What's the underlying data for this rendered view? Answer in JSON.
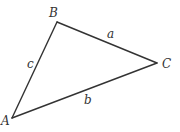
{
  "diagram": {
    "type": "triangle",
    "vertices": [
      {
        "id": "A",
        "label": "A",
        "x": 12,
        "y": 118,
        "label_x": 1,
        "label_y": 125
      },
      {
        "id": "B",
        "label": "B",
        "x": 57,
        "y": 22,
        "label_x": 49,
        "label_y": 17
      },
      {
        "id": "C",
        "label": "C",
        "x": 157,
        "y": 63,
        "label_x": 162,
        "label_y": 68
      }
    ],
    "sides": [
      {
        "id": "a",
        "label": "a",
        "from": "B",
        "to": "C",
        "label_x": 107,
        "label_y": 38
      },
      {
        "id": "b",
        "label": "b",
        "from": "A",
        "to": "C",
        "label_x": 84,
        "label_y": 104
      },
      {
        "id": "c",
        "label": "c",
        "from": "A",
        "to": "B",
        "label_x": 27,
        "label_y": 68
      }
    ],
    "stroke_color": "#333333"
  }
}
